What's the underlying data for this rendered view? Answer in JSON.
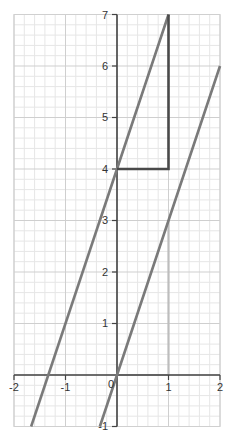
{
  "chart_data": {
    "type": "line",
    "title": "",
    "xlabel": "",
    "ylabel": "",
    "xlim": [
      -2,
      2
    ],
    "ylim": [
      -1,
      7
    ],
    "grid": true,
    "minor_grid_step": 0.2,
    "x_ticks": [
      -2,
      -1,
      0,
      1,
      2
    ],
    "y_ticks": [
      -1,
      1,
      2,
      3,
      4,
      5,
      6,
      7
    ],
    "x_tick_labels": [
      "-2",
      "-1",
      "0",
      "1",
      "2"
    ],
    "y_tick_labels": [
      "-1",
      "1",
      "2",
      "3",
      "4",
      "5",
      "6",
      "7"
    ],
    "series": [
      {
        "name": "y = 3x + 4",
        "slope": 3,
        "intercept": 4,
        "x": [
          -1.667,
          1
        ],
        "y": [
          -1,
          7
        ],
        "color": "#7a7a7a"
      },
      {
        "name": "y = 3x",
        "slope": 3,
        "intercept": 0,
        "x": [
          -0.333,
          2
        ],
        "y": [
          -1,
          6
        ],
        "color": "#7a7a7a"
      }
    ],
    "annotations": [
      {
        "type": "slope-triangle",
        "points": [
          [
            0,
            4
          ],
          [
            1,
            4
          ],
          [
            1,
            7
          ]
        ],
        "color": "#4a4a4a",
        "note": "run 1, rise 3"
      },
      {
        "type": "slope-triangle",
        "points": [
          [
            0,
            0
          ],
          [
            1,
            0
          ],
          [
            1,
            3
          ]
        ],
        "color": "#bdbdbd",
        "note": "run 1, rise 3"
      }
    ],
    "legend": null
  },
  "colors": {
    "background": "#ffffff",
    "minor_grid": "#e6e6e6",
    "major_grid": "#cfcfcf",
    "axis": "#444444",
    "line": "#7a7a7a",
    "dark_triangle": "#4a4a4a",
    "light_triangle": "#bdbdbd"
  },
  "labels": {
    "x_m2": "-2",
    "x_m1": "-1",
    "x_0": "0",
    "x_1": "1",
    "x_2": "2",
    "y_m1": "-1",
    "y_1": "1",
    "y_2": "2",
    "y_3": "3",
    "y_4": "4",
    "y_5": "5",
    "y_6": "6",
    "y_7": "7"
  }
}
